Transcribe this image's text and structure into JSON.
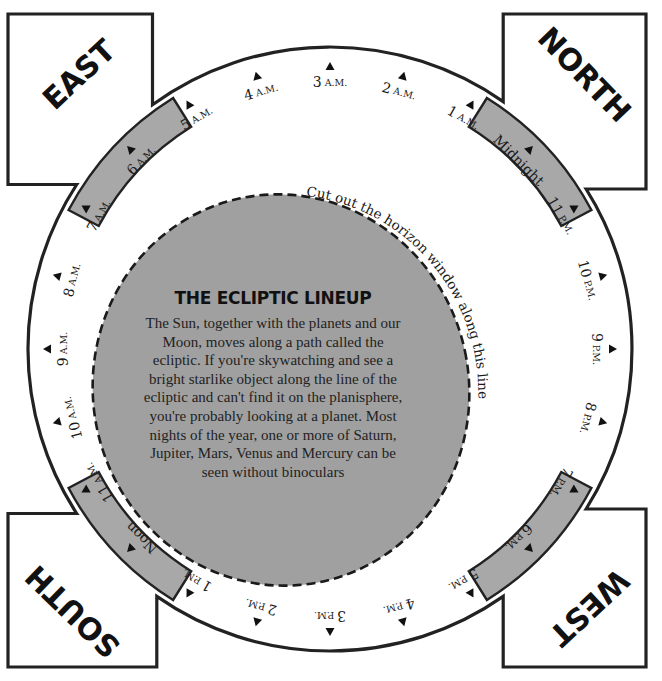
{
  "directions": {
    "east": "EAST",
    "north": "NORTH",
    "west": "WEST",
    "south": "SOUTH"
  },
  "cut_instruction": "Cut out the horizon window along this line",
  "info_box": {
    "heading": "THE ECLIPTIC LINEUP",
    "body": "The Sun, together with the planets and our Moon, moves along a path called the ecliptic. If you're skywatching and see a bright starlike object along the line of the ecliptic and can't find it on the planisphere, you're probably looking at a planet. Most nights of the year, one or more of Saturn, Jupiter, Mars, Venus and Mercury can be seen without binoculars"
  },
  "hour_marks": [
    {
      "num": "3",
      "suffix": "A.M."
    },
    {
      "num": "2",
      "suffix": "A.M."
    },
    {
      "num": "1",
      "suffix": "A.M."
    },
    {
      "num": "Midnight",
      "suffix": ""
    },
    {
      "num": "11",
      "suffix": "P.M."
    },
    {
      "num": "10",
      "suffix": "P.M."
    },
    {
      "num": "9",
      "suffix": "P.M."
    },
    {
      "num": "8",
      "suffix": "P.M."
    },
    {
      "num": "7",
      "suffix": "P.M."
    },
    {
      "num": "6",
      "suffix": "P.M."
    },
    {
      "num": "5",
      "suffix": "P.M."
    },
    {
      "num": "4",
      "suffix": "P.M."
    },
    {
      "num": "3",
      "suffix": "P.M."
    },
    {
      "num": "2",
      "suffix": "P.M."
    },
    {
      "num": "1",
      "suffix": "P.M."
    },
    {
      "num": "Noon",
      "suffix": ""
    },
    {
      "num": "11",
      "suffix": "A.M."
    },
    {
      "num": "10",
      "suffix": "A.M."
    },
    {
      "num": "9",
      "suffix": "A.M."
    },
    {
      "num": "8",
      "suffix": "A.M."
    },
    {
      "num": "7",
      "suffix": "A.M."
    },
    {
      "num": "6",
      "suffix": "A.M."
    },
    {
      "num": "5",
      "suffix": "A.M."
    },
    {
      "num": "4",
      "suffix": "A.M."
    }
  ],
  "colors": {
    "outline": "#222222",
    "band_fill": "#a8a8a8",
    "window_fill": "#9f9f9f",
    "text": "#1a1a1a"
  }
}
